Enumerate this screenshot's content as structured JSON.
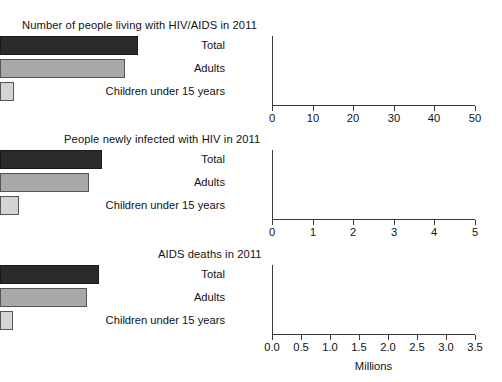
{
  "chart_data": [
    {
      "type": "bar",
      "orientation": "horizontal",
      "title": "Number of people living with HIV/AIDS in 2011",
      "categories": [
        "Total",
        "Adults",
        "Children under 15 years"
      ],
      "values": [
        34.0,
        30.7,
        3.4
      ],
      "xlabel": "",
      "ylabel": "",
      "xlim": [
        0,
        50
      ],
      "xticks": [
        0,
        10,
        20,
        30,
        40,
        50
      ],
      "xticklabels": [
        "0",
        "10",
        "20",
        "30",
        "40",
        "50"
      ],
      "grid": false,
      "legend": false,
      "bar_colors": [
        "#2b2b2b",
        "#a9a9a9",
        "#d4d4d4"
      ]
    },
    {
      "type": "bar",
      "orientation": "horizontal",
      "title": "People newly infected with HIV in 2011",
      "categories": [
        "Total",
        "Adults",
        "Children under 15 years"
      ],
      "values": [
        2.5,
        2.2,
        0.47
      ],
      "xlabel": "",
      "ylabel": "",
      "xlim": [
        0,
        5
      ],
      "xticks": [
        0,
        1,
        2,
        3,
        4,
        5
      ],
      "xticklabels": [
        "0",
        "1",
        "2",
        "3",
        "4",
        "5"
      ],
      "grid": false,
      "legend": false,
      "bar_colors": [
        "#2b2b2b",
        "#a9a9a9",
        "#d4d4d4"
      ]
    },
    {
      "type": "bar",
      "orientation": "horizontal",
      "title": "AIDS deaths in 2011",
      "categories": [
        "Total",
        "Adults",
        "Children under 15 years"
      ],
      "values": [
        1.7,
        1.5,
        0.23
      ],
      "xlabel": "Millions",
      "ylabel": "",
      "xlim": [
        0,
        3.5
      ],
      "xticks": [
        0.0,
        0.5,
        1.0,
        1.5,
        2.0,
        2.5,
        3.0,
        3.5
      ],
      "xticklabels": [
        "0.0",
        "0.5",
        "1.0",
        "1.5",
        "2.0",
        "2.5",
        "3.0",
        "3.5"
      ],
      "grid": false,
      "legend": false,
      "bar_colors": [
        "#2b2b2b",
        "#a9a9a9",
        "#d4d4d4"
      ]
    }
  ]
}
